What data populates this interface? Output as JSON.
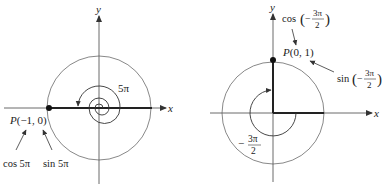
{
  "left_figure": {
    "axis_x_label": "x",
    "axis_y_label": "y",
    "angle_label": "5π",
    "point_label": "P(−1, 0)",
    "cos_label": "cos 5π",
    "sin_label": "sin 5π"
  },
  "right_figure": {
    "axis_x_label": "x",
    "axis_y_label": "y",
    "point_label": "P(0, 1)",
    "cos_label_prefix": "cos",
    "sin_label_prefix": "sin",
    "frac_sign": "−",
    "frac_num": "3π",
    "frac_den": "2",
    "angle_sign": "−",
    "angle_num": "3π",
    "angle_den": "2"
  },
  "colors": {
    "line": "#333333",
    "thick": "#222222",
    "text": "#222222"
  }
}
